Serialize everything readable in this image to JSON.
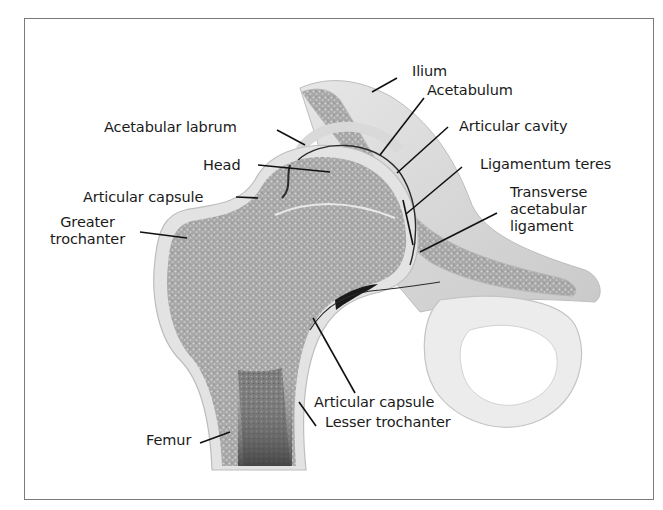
{
  "diagram": {
    "labels": {
      "ilium": "Ilium",
      "acetabulum": "Acetabulum",
      "acetabular_labrum": "Acetabular labrum",
      "articular_cavity": "Articular cavity",
      "head": "Head",
      "ligamentum_teres": "Ligamentum teres",
      "articular_capsule_upper": "Articular capsule",
      "transverse_acetabular_ligament": "Transverse\nacetabular\nligament",
      "greater_trochanter": "Greater\ntrochanter",
      "articular_capsule_lower": "Articular capsule",
      "lesser_trochanter": "Lesser trochanter",
      "femur": "Femur"
    },
    "colors": {
      "bone_texture": "#9a9a9a",
      "cortex": "#e2e2e2",
      "leader_line": "#111111",
      "frame_border": "#7a7a7a"
    }
  }
}
